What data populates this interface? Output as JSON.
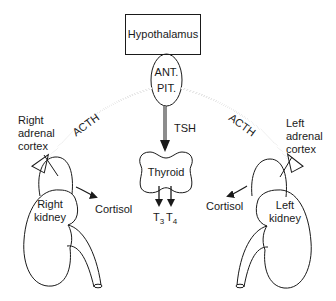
{
  "diagram": {
    "hypothalamus": "Hypothalamus",
    "pituitary": {
      "line1": "ANT.",
      "line2": "PIT."
    },
    "hormones": {
      "acth_left": "ACTH",
      "acth_right": "ACTH",
      "tsh": "TSH"
    },
    "thyroid": {
      "label": "Thyroid",
      "outputs": {
        "t3": "T",
        "t3_sub": "3",
        "t4": "T",
        "t4_sub": "4"
      }
    },
    "right_side": {
      "adrenal": [
        "Right",
        "adrenal",
        "cortex"
      ],
      "kidney": [
        "Right",
        "kidney"
      ],
      "cortisol": "Cortisol"
    },
    "left_side": {
      "adrenal": [
        "Left",
        "adrenal",
        "cortex"
      ],
      "kidney": [
        "Left",
        "kidney"
      ],
      "cortisol": "Cortisol"
    },
    "colors": {
      "line": "#1a1a1a",
      "background": "#ffffff"
    }
  }
}
